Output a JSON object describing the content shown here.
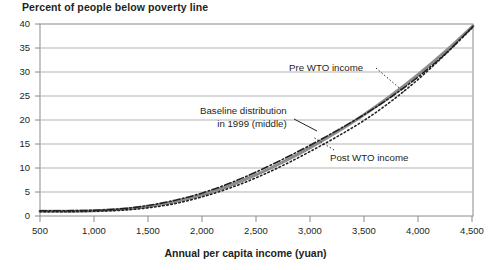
{
  "chart_data": {
    "type": "line",
    "title": "Percent of people below poverty line",
    "xlabel": "Annual per capita income (yuan)",
    "ylabel": "",
    "xlim": [
      500,
      4500
    ],
    "ylim": [
      0,
      40
    ],
    "grid": true,
    "legend_position": "inline-annotations",
    "xticks": [
      "500",
      "1,000",
      "1,500",
      "2,000",
      "2,500",
      "3,000",
      "3,500",
      "4,000",
      "4,500"
    ],
    "xtick_values": [
      500,
      1000,
      1500,
      2000,
      2500,
      3000,
      3500,
      4000,
      4500
    ],
    "yticks": [
      "0",
      "5",
      "10",
      "15",
      "20",
      "25",
      "30",
      "35",
      "40"
    ],
    "ytick_values": [
      0,
      5,
      10,
      15,
      20,
      25,
      30,
      35,
      40
    ],
    "x": [
      500,
      750,
      1000,
      1250,
      1500,
      1750,
      2000,
      2250,
      2500,
      2750,
      3000,
      3250,
      3500,
      3750,
      4000,
      4250,
      4500
    ],
    "series": [
      {
        "name": "Pre WTO income",
        "style": "dotted",
        "color": "#231f20",
        "values": [
          0.9,
          0.9,
          1.0,
          1.2,
          1.7,
          2.6,
          4.0,
          5.8,
          8.0,
          10.6,
          13.5,
          16.6,
          20.0,
          24.0,
          28.6,
          33.8,
          39.4
        ]
      },
      {
        "name": "Baseline distribution in 1999 (middle)",
        "style": "solid-thick-gray",
        "color": "#8c8c8c",
        "values": [
          1.0,
          1.0,
          1.1,
          1.4,
          2.0,
          3.0,
          4.4,
          6.3,
          8.6,
          11.3,
          14.3,
          17.6,
          21.2,
          25.2,
          29.6,
          34.4,
          39.6
        ]
      },
      {
        "name": "Post WTO income",
        "style": "dash-dot",
        "color": "#231f20",
        "values": [
          1.1,
          1.1,
          1.2,
          1.5,
          2.2,
          3.3,
          4.8,
          6.8,
          9.2,
          11.9,
          14.8,
          17.9,
          21.2,
          24.9,
          29.1,
          33.9,
          39.5
        ]
      }
    ],
    "annotations": [
      {
        "id": "pre",
        "text": "Pre WTO income"
      },
      {
        "id": "baseline_line1",
        "text": "Baseline distribution"
      },
      {
        "id": "baseline_line2",
        "text": "in 1999 (middle)"
      },
      {
        "id": "post",
        "text": "Post WTO income"
      }
    ]
  },
  "colors": {
    "axis": "#8a8a8a",
    "grid": "#b3b3b3",
    "text": "#231f20",
    "baseline_line": "#8c8c8c",
    "wto_line": "#231f20",
    "background": "#ffffff"
  }
}
